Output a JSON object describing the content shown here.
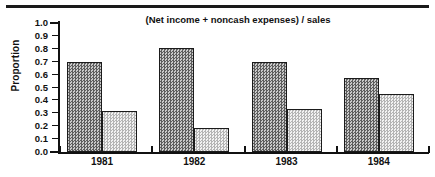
{
  "figure": {
    "top_rule": true,
    "background_color": "#ffffff"
  },
  "chart_data": {
    "type": "bar",
    "title": "(Net income  +  noncash expenses) / sales",
    "xlabel": "",
    "ylabel": "Proportion",
    "categories": [
      "1981",
      "1982",
      "1983",
      "1984"
    ],
    "series": [
      {
        "name": "dark",
        "values": [
          0.7,
          0.81,
          0.7,
          0.57
        ],
        "fill": "dark-checker",
        "color": "#8f8f8f"
      },
      {
        "name": "light",
        "values": [
          0.32,
          0.19,
          0.33,
          0.45
        ],
        "fill": "light-checker",
        "color": "#dadada"
      }
    ],
    "ylim": [
      0.0,
      1.0
    ],
    "ytick_labels": [
      "1.0",
      "0.9",
      "0.8",
      "0.7",
      "0.6",
      "0.5",
      "0.4",
      "0.3",
      "0.2",
      "0.1",
      "0.0"
    ],
    "ytick_values": [
      1.0,
      0.9,
      0.8,
      0.7,
      0.6,
      0.5,
      0.4,
      0.3,
      0.2,
      0.1,
      0.0
    ],
    "grid": false,
    "legend": false,
    "legend_position": "none"
  }
}
